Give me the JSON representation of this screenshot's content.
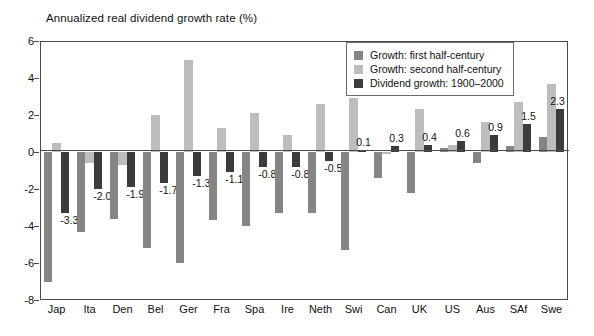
{
  "chart_data": {
    "type": "bar",
    "title": "Annualized real dividend growth rate (%)",
    "xlabel": "",
    "ylabel": "",
    "ylim": [
      -8,
      6
    ],
    "yticks": [
      6,
      4,
      2,
      0,
      -2,
      -4,
      -6,
      -8
    ],
    "grid": false,
    "legend_position": "top-right",
    "categories": [
      "Jap",
      "Ita",
      "Den",
      "Bel",
      "Ger",
      "Fra",
      "Spa",
      "Ire",
      "Neth",
      "Swi",
      "Can",
      "UK",
      "US",
      "Aus",
      "SAf",
      "Swe"
    ],
    "series": [
      {
        "name": "Growth: first half-century",
        "color": "#858585",
        "values": [
          -7.0,
          -4.3,
          -3.6,
          -5.2,
          -6.0,
          -3.7,
          -4.0,
          -3.3,
          -3.3,
          -5.3,
          -1.4,
          -2.2,
          0.2,
          -0.6,
          0.3,
          0.8
        ]
      },
      {
        "name": "Growth: second half-century",
        "color": "#bdbdbd",
        "values": [
          0.5,
          -0.6,
          -0.7,
          2.0,
          5.0,
          1.3,
          2.1,
          0.9,
          2.6,
          2.9,
          -0.1,
          2.3,
          0.4,
          1.6,
          2.7,
          3.7
        ]
      },
      {
        "name": "Dividend growth: 1900-2000",
        "color": "#3b3b3b",
        "values": [
          -3.3,
          -2.0,
          -1.9,
          -1.7,
          -1.3,
          -1.1,
          -0.8,
          -0.8,
          -0.5,
          0.1,
          0.3,
          0.4,
          0.6,
          0.9,
          1.5,
          2.3
        ]
      }
    ],
    "data_labels": [
      "-3.3",
      "-2.0",
      "-1.9",
      "-1.7",
      "-1.3",
      "-1.1",
      "-0.8",
      "-0.8",
      "-0.5",
      "0.1",
      "0.3",
      "0.4",
      "0.6",
      "0.9",
      "1.5",
      "2.3"
    ]
  },
  "legend": {
    "items": [
      {
        "label": "Growth: first half-century",
        "swatch": "s0"
      },
      {
        "label": "Growth: second half-century",
        "swatch": "s1"
      },
      {
        "label": "Dividend growth: 1900–2000",
        "swatch": "s2"
      }
    ]
  }
}
